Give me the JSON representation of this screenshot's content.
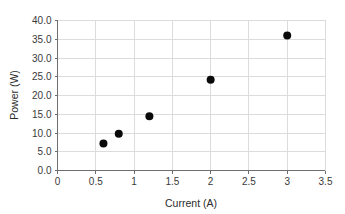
{
  "chart_data": {
    "type": "scatter",
    "title": "",
    "xlabel": "Current (A)",
    "ylabel": "Power (W)",
    "xlim": [
      0,
      3.5
    ],
    "ylim": [
      0,
      40
    ],
    "grid": true,
    "legend": "none",
    "marker": {
      "shape": "circle",
      "color": "#0a0a0a",
      "size_px": 5
    },
    "x_ticks": [
      0,
      0.5,
      1,
      1.5,
      2,
      2.5,
      3,
      3.5
    ],
    "x_tick_labels": [
      "0",
      "0.5",
      "1",
      "1.5",
      "2",
      "2.5",
      "3",
      "3.5"
    ],
    "y_ticks": [
      0,
      5,
      10,
      15,
      20,
      25,
      30,
      35,
      40
    ],
    "y_tick_labels": [
      "0.0",
      "5.0",
      "10.0",
      "15.0",
      "20.0",
      "25.0",
      "30.0",
      "35.0",
      "40.0"
    ],
    "x": [
      0.6,
      0.8,
      1.2,
      2.0,
      3.0
    ],
    "y": [
      7.2,
      9.8,
      14.5,
      24.2,
      36.0
    ],
    "points": [
      {
        "x": 0.6,
        "y": 7.2
      },
      {
        "x": 0.8,
        "y": 9.8
      },
      {
        "x": 1.2,
        "y": 14.5
      },
      {
        "x": 2.0,
        "y": 24.2
      },
      {
        "x": 3.0,
        "y": 36.0
      }
    ]
  },
  "colors": {
    "background": "#ffffff",
    "grid": "#dcdcdc",
    "axis": "#6e6e6e",
    "text": "#2b2b2b",
    "marker": "#0a0a0a"
  }
}
